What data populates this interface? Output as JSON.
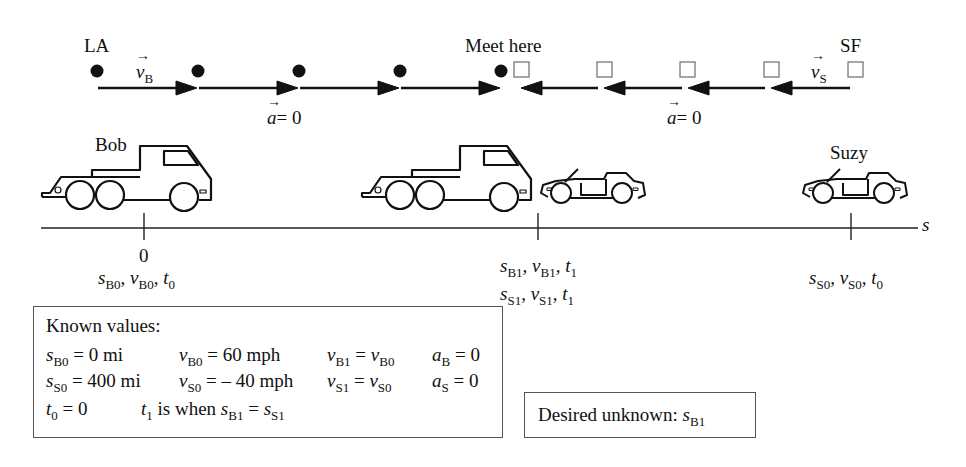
{
  "motion_diagram": {
    "left_city": "LA",
    "right_city": "SF",
    "meet_label": "Meet here",
    "bob_velocity": {
      "symbol": "v",
      "sub": "B"
    },
    "suzy_velocity": {
      "symbol": "v",
      "sub": "S"
    },
    "bob_accel": {
      "symbol": "a",
      "eq": "= 0"
    },
    "suzy_accel": {
      "symbol": "a",
      "eq": "= 0"
    },
    "bob_dots_x": [
      97,
      198,
      298,
      400,
      500
    ],
    "suzy_squares_x": [
      520,
      604,
      686,
      770,
      854
    ]
  },
  "vehicles": {
    "bob_label": "Bob",
    "suzy_label": "Suzy"
  },
  "axis": {
    "label": "s",
    "ticks": [
      {
        "x": 145,
        "value": "0",
        "lines": [
          [
            {
              "v": "s",
              "s": "B0"
            },
            {
              "v": "v",
              "s": "B0"
            },
            {
              "v": "t",
              "s": "0"
            }
          ]
        ]
      },
      {
        "x": 538,
        "value": "",
        "lines": [
          [
            {
              "v": "s",
              "s": "B1"
            },
            {
              "v": "v",
              "s": "B1"
            },
            {
              "v": "t",
              "s": "1"
            }
          ],
          [
            {
              "v": "s",
              "s": "S1"
            },
            {
              "v": "v",
              "s": "S1"
            },
            {
              "v": "t",
              "s": "1"
            }
          ]
        ]
      },
      {
        "x": 851,
        "value": "",
        "lines": [
          [
            {
              "v": "s",
              "s": "S0"
            },
            {
              "v": "v",
              "s": "S0"
            },
            {
              "v": "t",
              "s": "0"
            }
          ]
        ]
      }
    ]
  },
  "known_values": {
    "title": "Known values:",
    "rows": [
      [
        "s_B0 = 0 mi",
        "v_B0 = 60 mph",
        "v_B1 = v_B0",
        "a_B = 0"
      ],
      [
        "s_S0 = 400 mi",
        "v_S0 = – 40 mph",
        "v_S1 = v_S0",
        "a_S = 0"
      ],
      [
        "t_0 = 0",
        "t_1 is when s_B1 = s_S1"
      ]
    ],
    "r1": {
      "c1_val": "= 0 mi",
      "c2_val": "=  60 mph",
      "c3_eq": "=",
      "c4_val": "= 0"
    },
    "r2": {
      "c1_val": "= 400 mi",
      "c2_val": "= – 40 mph",
      "c3_eq": "=",
      "c4_val": "= 0"
    },
    "r3": {
      "c1_val": "= 0",
      "c2_text": "is when",
      "c2_eq": "="
    }
  },
  "desired_unknown": {
    "label": "Desired unknown:",
    "symbol": "s",
    "sub": "B1"
  }
}
